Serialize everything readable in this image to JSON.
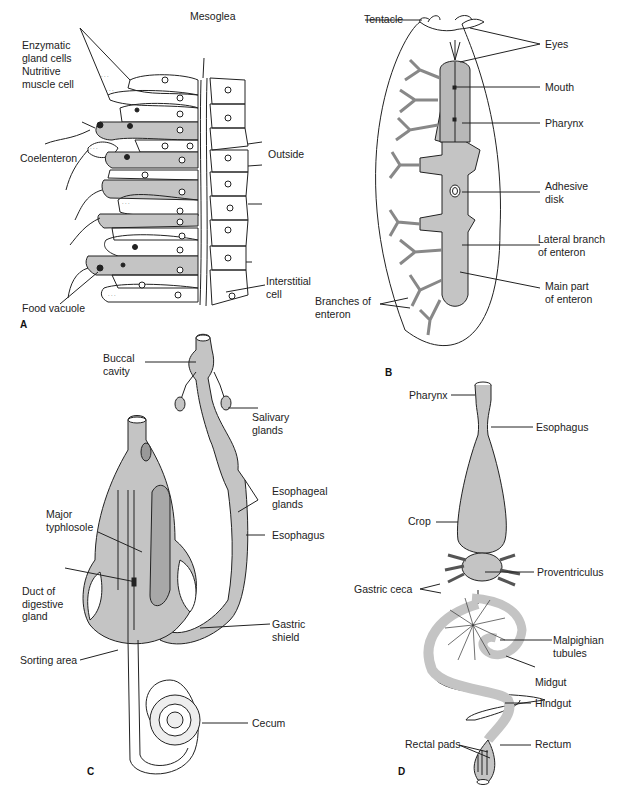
{
  "colors": {
    "fill": "#c4c4c4",
    "stroke": "#222222",
    "background": "#ffffff"
  },
  "panels": {
    "A": {
      "letter": "A",
      "labels": {
        "mesoglea": "Mesoglea",
        "enzymatic": "Enzymatic\ngland cells",
        "nutritive": "Nutritive\nmuscle cell",
        "coelenteron": "Coelenteron",
        "outside": "Outside",
        "interstitial": "Interstitial\ncell",
        "food_vacuole": "Food vacuole"
      }
    },
    "B": {
      "letter": "B",
      "labels": {
        "tentacle": "Tentacle",
        "eyes": "Eyes",
        "mouth": "Mouth",
        "pharynx": "Pharynx",
        "adhesive": "Adhesive\ndisk",
        "lateral": "Lateral branch\nof enteron",
        "main": "Main part\nof enteron",
        "branches": "Branches of\nenteron"
      }
    },
    "C": {
      "letter": "C",
      "labels": {
        "buccal": "Buccal\ncavity",
        "salivary": "Salivary\nglands",
        "esoph_glands": "Esophageal\nglands",
        "esophagus": "Esophagus",
        "typhlosole": "Major\ntyphlosole",
        "duct": "Duct of\ndigestive\ngland",
        "gastric_shield": "Gastric\nshield",
        "sorting": "Sorting area",
        "cecum": "Cecum"
      }
    },
    "D": {
      "letter": "D",
      "labels": {
        "pharynx": "Pharynx",
        "esophagus": "Esophagus",
        "crop": "Crop",
        "proventriculus": "Proventriculus",
        "gastric_ceca": "Gastric ceca",
        "malpighian": "Malpighian\ntubules",
        "midgut": "Midgut",
        "hindgut": "Hindgut",
        "rectal_pads": "Rectal pads",
        "rectum": "Rectum"
      }
    }
  }
}
